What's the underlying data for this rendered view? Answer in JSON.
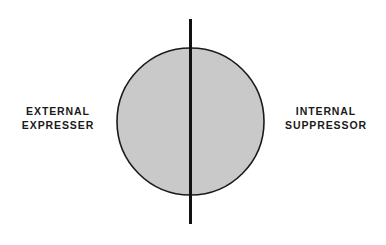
{
  "figure": {
    "background_color": "#ffffff",
    "type": "two-sided-continuum-diagram",
    "circle": {
      "name": "personality-circle",
      "fill_color": "#c9c9c9",
      "stroke_color": "#1a1a1a",
      "stroke_width": 1.6,
      "center_x": 190.5,
      "center_y": 121.5,
      "radius": 73.5
    },
    "divider_line": {
      "name": "vertical-divider",
      "color": "#111111",
      "width": 3,
      "x": 190.5,
      "y_top": 19,
      "y_bottom": 224
    }
  },
  "labels": {
    "left": {
      "line1": "EXTERNAL",
      "line2": "EXPRESSER",
      "color": "#1a1a1a"
    },
    "right": {
      "line1": "INTERNAL",
      "line2": "SUPPRESSOR",
      "color": "#1a1a1a"
    }
  }
}
